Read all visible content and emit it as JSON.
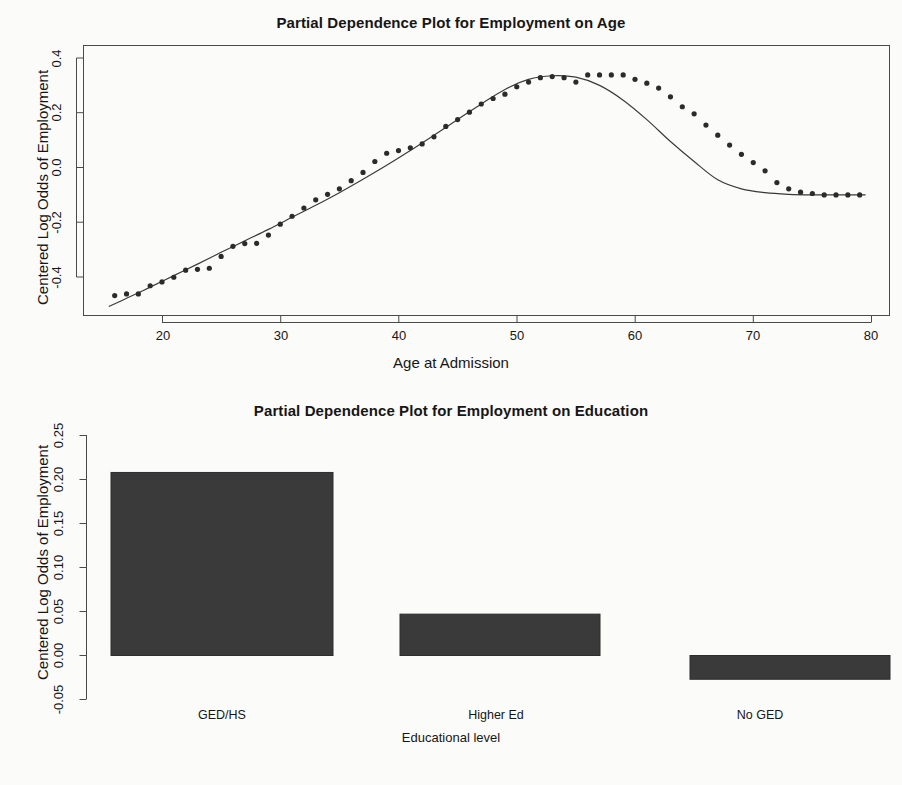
{
  "chart_data": [
    {
      "type": "scatter",
      "title": "Partial Dependence Plot for Employment on Age",
      "xlabel": "Age at Admission",
      "ylabel": "Centered Log Odds of Employment",
      "xlim": [
        15,
        80
      ],
      "ylim": [
        -0.52,
        0.42
      ],
      "xticks": [
        20,
        30,
        40,
        50,
        60,
        70,
        80
      ],
      "xtick_labels": [
        "20",
        "30",
        "40",
        "50",
        "60",
        "70",
        "80"
      ],
      "yticks": [
        0.4,
        0.2,
        0.0,
        -0.2,
        -0.4
      ],
      "ytick_labels": [
        "0.4",
        "0.2",
        "0.0",
        "-0.2",
        "-0.4"
      ],
      "grid": false,
      "legend": "none",
      "point_color": "#2b2b2b",
      "line_color": "#3a3a3a",
      "series": [
        {
          "name": "partial dependence points",
          "marker": "filled-circle",
          "x": [
            16,
            17,
            18,
            19,
            20,
            21,
            22,
            23,
            24,
            25,
            26,
            27,
            28,
            29,
            30,
            31,
            32,
            33,
            34,
            35,
            36,
            37,
            38,
            39,
            40,
            41,
            42,
            43,
            44,
            45,
            46,
            47,
            48,
            49,
            50,
            51,
            52,
            53,
            54,
            55,
            56,
            57,
            58,
            59,
            60,
            61,
            62,
            63,
            64,
            65,
            66,
            67,
            68,
            69,
            70,
            71,
            72,
            73,
            74,
            75,
            76,
            77,
            78,
            79
          ],
          "y": [
            -0.468,
            -0.462,
            -0.462,
            -0.432,
            -0.418,
            -0.401,
            -0.375,
            -0.372,
            -0.368,
            -0.325,
            -0.288,
            -0.278,
            -0.277,
            -0.247,
            -0.207,
            -0.178,
            -0.148,
            -0.118,
            -0.098,
            -0.078,
            -0.048,
            -0.018,
            0.022,
            0.052,
            0.062,
            0.072,
            0.086,
            0.112,
            0.15,
            0.175,
            0.202,
            0.232,
            0.252,
            0.268,
            0.295,
            0.312,
            0.328,
            0.332,
            0.328,
            0.312,
            0.338,
            0.338,
            0.338,
            0.338,
            0.322,
            0.308,
            0.29,
            0.258,
            0.222,
            0.196,
            0.155,
            0.118,
            0.082,
            0.048,
            0.018,
            -0.012,
            -0.055,
            -0.078,
            -0.09,
            -0.095,
            -0.1,
            -0.1,
            -0.1,
            -0.1
          ]
        },
        {
          "name": "smoothed fit",
          "style": "line",
          "x": [
            15.5,
            17,
            19,
            21,
            23,
            25,
            27,
            29,
            31,
            33,
            35,
            37,
            39,
            41,
            43,
            45,
            47,
            49,
            51,
            53,
            55,
            57,
            59,
            61,
            63,
            65,
            67,
            69,
            71,
            73,
            75,
            77,
            79.5
          ],
          "y": [
            -0.508,
            -0.478,
            -0.437,
            -0.395,
            -0.353,
            -0.31,
            -0.268,
            -0.226,
            -0.182,
            -0.138,
            -0.092,
            -0.043,
            0.008,
            0.062,
            0.118,
            0.175,
            0.232,
            0.285,
            0.322,
            0.335,
            0.33,
            0.3,
            0.246,
            0.175,
            0.095,
            0.022,
            -0.045,
            -0.078,
            -0.092,
            -0.098,
            -0.1,
            -0.1,
            -0.1
          ]
        }
      ]
    },
    {
      "type": "bar",
      "title": "Partial Dependence Plot for Employment on Education",
      "xlabel": "Educational level",
      "ylabel": "Centered Log Odds of Employment",
      "categories": [
        "GED/HS",
        "Higher Ed",
        "No GED"
      ],
      "values": [
        0.208,
        0.047,
        -0.027
      ],
      "yticks": [
        -0.05,
        0.0,
        0.05,
        0.1,
        0.15,
        0.2,
        0.25
      ],
      "ytick_labels": [
        "-0.05",
        "0.00",
        "0.05",
        "0.10",
        "0.15",
        "0.20",
        "0.25"
      ],
      "ylim": [
        -0.05,
        0.25
      ],
      "grid": false,
      "legend": "none",
      "bar_color": "#3a3a3a",
      "bar_edge_color": "#2d2d2d"
    }
  ],
  "figure_age": {
    "title": "Partial Dependence Plot for Employment on Age",
    "xlabel": "Age at Admission",
    "ylabel": "Centered Log Odds of Employment",
    "xticks": [
      "20",
      "30",
      "40",
      "50",
      "60",
      "70",
      "80"
    ],
    "yticks": [
      "0.4",
      "0.2",
      "0.0",
      "-0.2",
      "-0.4"
    ]
  },
  "figure_education": {
    "title": "Partial Dependence Plot for Employment on Education",
    "xlabel": "Educational level",
    "ylabel": "Centered Log Odds of Employment",
    "categories": [
      "GED/HS",
      "Higher Ed",
      "No GED"
    ],
    "yticks": [
      "0.25",
      "0.20",
      "0.15",
      "0.10",
      "0.05",
      "0.00",
      "-0.05"
    ]
  },
  "footer": {
    "ghost_text": ""
  }
}
